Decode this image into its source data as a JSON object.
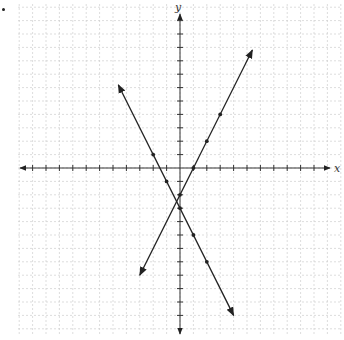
{
  "chart_data": {
    "type": "line",
    "title": "",
    "xlabel": "x",
    "ylabel": "y",
    "xlim": [
      -11.5,
      11.5
    ],
    "ylim": [
      -12,
      11.5
    ],
    "grid": true,
    "grid_step": 1,
    "origin_px": [
      180,
      168
    ],
    "unit_px": 13.4,
    "series": [
      {
        "name": "line-decreasing",
        "equation": "y = -2x - 3",
        "slope": -2,
        "intercept": -3,
        "x_range": [
          -4.6,
          4.0
        ],
        "marked_points": [
          [
            -2,
            1
          ],
          [
            -1,
            -1
          ],
          [
            0,
            -3
          ],
          [
            1,
            -5
          ],
          [
            2,
            -7
          ]
        ]
      },
      {
        "name": "line-increasing",
        "equation": "y = 2x - 2",
        "slope": 2,
        "intercept": -2,
        "x_range": [
          -3.0,
          5.4
        ],
        "marked_points": [
          [
            0,
            -2
          ],
          [
            1,
            0
          ],
          [
            2,
            2
          ],
          [
            3,
            4
          ]
        ]
      }
    ]
  },
  "axes": {
    "x_label": "x",
    "y_label": "y"
  },
  "colors": {
    "axis": "#333333",
    "line": "#222222",
    "grid": "#cfcfcf"
  }
}
